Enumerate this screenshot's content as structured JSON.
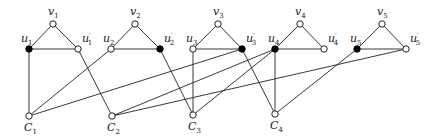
{
  "diagram": {
    "type": "graph",
    "vertices": [
      {
        "id": "v1",
        "label": "v",
        "sub": "1",
        "prime": false,
        "x": 53,
        "y": 24,
        "filled": false,
        "lx": 48,
        "ly": 15
      },
      {
        "id": "u1",
        "label": "u",
        "sub": "1",
        "prime": false,
        "x": 29,
        "y": 49,
        "filled": true,
        "lx": 21,
        "ly": 42
      },
      {
        "id": "u1p",
        "label": "u",
        "sub": "1",
        "prime": true,
        "x": 78,
        "y": 49,
        "filled": false,
        "lx": 82,
        "ly": 42
      },
      {
        "id": "v2",
        "label": "v",
        "sub": "2",
        "prime": false,
        "x": 135,
        "y": 24,
        "filled": false,
        "lx": 130,
        "ly": 15
      },
      {
        "id": "u2",
        "label": "u",
        "sub": "2",
        "prime": false,
        "x": 111,
        "y": 49,
        "filled": false,
        "lx": 103,
        "ly": 42
      },
      {
        "id": "u2p",
        "label": "u",
        "sub": "2",
        "prime": true,
        "x": 160,
        "y": 49,
        "filled": true,
        "lx": 164,
        "ly": 42
      },
      {
        "id": "v3",
        "label": "v",
        "sub": "3",
        "prime": false,
        "x": 218,
        "y": 24,
        "filled": false,
        "lx": 213,
        "ly": 15
      },
      {
        "id": "u3",
        "label": "u",
        "sub": "3",
        "prime": false,
        "x": 193,
        "y": 49,
        "filled": false,
        "lx": 186,
        "ly": 42
      },
      {
        "id": "u3p",
        "label": "u",
        "sub": "3",
        "prime": true,
        "x": 242,
        "y": 49,
        "filled": true,
        "lx": 246,
        "ly": 42
      },
      {
        "id": "v4",
        "label": "v",
        "sub": "4",
        "prime": false,
        "x": 300,
        "y": 24,
        "filled": false,
        "lx": 295,
        "ly": 15
      },
      {
        "id": "u4",
        "label": "u",
        "sub": "4",
        "prime": false,
        "x": 275,
        "y": 49,
        "filled": true,
        "lx": 268,
        "ly": 42
      },
      {
        "id": "u4p",
        "label": "u",
        "sub": "4",
        "prime": true,
        "x": 324,
        "y": 49,
        "filled": false,
        "lx": 328,
        "ly": 42
      },
      {
        "id": "v5",
        "label": "v",
        "sub": "5",
        "prime": false,
        "x": 382,
        "y": 24,
        "filled": false,
        "lx": 377,
        "ly": 15
      },
      {
        "id": "u5",
        "label": "u",
        "sub": "5",
        "prime": false,
        "x": 357,
        "y": 49,
        "filled": true,
        "lx": 350,
        "ly": 42
      },
      {
        "id": "u5p",
        "label": "u",
        "sub": "5",
        "prime": true,
        "x": 406,
        "y": 49,
        "filled": false,
        "lx": 410,
        "ly": 42
      },
      {
        "id": "C1",
        "label": "C",
        "sub": "1",
        "prime": false,
        "x": 29,
        "y": 116,
        "filled": false,
        "lx": 24,
        "ly": 131
      },
      {
        "id": "C2",
        "label": "C",
        "sub": "2",
        "prime": false,
        "x": 112,
        "y": 116,
        "filled": false,
        "lx": 107,
        "ly": 131
      },
      {
        "id": "C3",
        "label": "C",
        "sub": "3",
        "prime": false,
        "x": 193,
        "y": 115,
        "filled": false,
        "lx": 188,
        "ly": 130
      },
      {
        "id": "C4",
        "label": "C",
        "sub": "4",
        "prime": false,
        "x": 275,
        "y": 114,
        "filled": false,
        "lx": 270,
        "ly": 129
      }
    ],
    "edges": [
      [
        "v1",
        "u1"
      ],
      [
        "v1",
        "u1p"
      ],
      [
        "u1",
        "u1p"
      ],
      [
        "v2",
        "u2"
      ],
      [
        "v2",
        "u2p"
      ],
      [
        "u2",
        "u2p"
      ],
      [
        "v3",
        "u3"
      ],
      [
        "v3",
        "u3p"
      ],
      [
        "u3",
        "u3p"
      ],
      [
        "v4",
        "u4"
      ],
      [
        "v4",
        "u4p"
      ],
      [
        "u4",
        "u4p"
      ],
      [
        "v5",
        "u5"
      ],
      [
        "v5",
        "u5p"
      ],
      [
        "u5",
        "u5p"
      ],
      [
        "u1",
        "C1"
      ],
      [
        "u1p",
        "C2"
      ],
      [
        "u2",
        "C1"
      ],
      [
        "u2p",
        "C3"
      ],
      [
        "u3",
        "C3"
      ],
      [
        "u3p",
        "C1"
      ],
      [
        "u3p",
        "C4"
      ],
      [
        "u4",
        "C2"
      ],
      [
        "u4",
        "C3"
      ],
      [
        "u4",
        "C4"
      ],
      [
        "u5",
        "C4"
      ],
      [
        "u5p",
        "C2"
      ]
    ]
  }
}
